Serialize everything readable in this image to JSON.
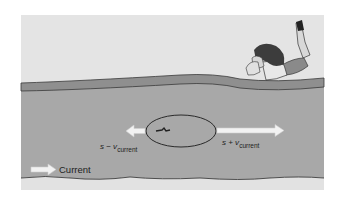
{
  "diagram": {
    "labels": {
      "upstream_prefix": "s − v",
      "upstream_sub": "current",
      "downstream_prefix": "s + v",
      "downstream_sub": "current",
      "current_label": "Current"
    },
    "colors": {
      "sky": "#e4e4e4",
      "bank_stripe": "#8f8f8f",
      "water": "#a8a8a8",
      "far_bank": "#e2e2e2",
      "outline": "#2a2a2a",
      "arrow_fill": "#f2f2f2"
    },
    "elements": {
      "observer": "person lying on bank watching swimmer",
      "swimmer": "swimmer inside ellipse in river"
    }
  }
}
